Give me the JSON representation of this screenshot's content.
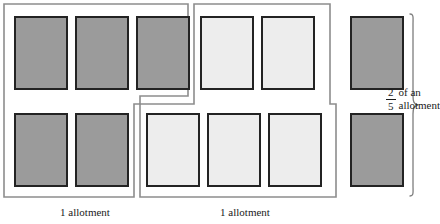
{
  "figure": {
    "colors": {
      "dark_fill": "#9b9b9b",
      "light_fill": "#ededed",
      "cell_border": "#232323",
      "group_outline": "#8d8d8d",
      "text": "#1a1a1a",
      "background": "#ffffff"
    },
    "groups": [
      {
        "name": "allotment-group-left",
        "caption": "1 allotment",
        "fill": "dark",
        "cell_count": 5
      },
      {
        "name": "allotment-group-right",
        "caption": "1 allotment",
        "fill": "light",
        "cell_count": 5
      },
      {
        "name": "partial-allotment-group",
        "fill": "dark",
        "cell_count": 2
      }
    ],
    "cells": [
      {
        "id": "left-top-1",
        "fill": "dark",
        "x": 14,
        "y": 16,
        "w": 54,
        "h": 74
      },
      {
        "id": "left-top-2",
        "fill": "dark",
        "x": 75,
        "y": 16,
        "w": 54,
        "h": 74
      },
      {
        "id": "left-top-3",
        "fill": "dark",
        "x": 136,
        "y": 16,
        "w": 54,
        "h": 74
      },
      {
        "id": "left-bot-1",
        "fill": "dark",
        "x": 14,
        "y": 113,
        "w": 54,
        "h": 74
      },
      {
        "id": "left-bot-2",
        "fill": "dark",
        "x": 75,
        "y": 113,
        "w": 54,
        "h": 74
      },
      {
        "id": "right-top-1",
        "fill": "light",
        "x": 200,
        "y": 16,
        "w": 54,
        "h": 74
      },
      {
        "id": "right-top-2",
        "fill": "light",
        "x": 261,
        "y": 16,
        "w": 54,
        "h": 74
      },
      {
        "id": "right-bot-1",
        "fill": "light",
        "x": 146,
        "y": 113,
        "w": 54,
        "h": 74
      },
      {
        "id": "right-bot-2",
        "fill": "light",
        "x": 207,
        "y": 113,
        "w": 54,
        "h": 74
      },
      {
        "id": "right-bot-3",
        "fill": "light",
        "x": 268,
        "y": 113,
        "w": 54,
        "h": 74
      },
      {
        "id": "partial-top-1",
        "fill": "dark",
        "x": 350,
        "y": 16,
        "w": 54,
        "h": 74
      },
      {
        "id": "partial-bot-1",
        "fill": "dark",
        "x": 350,
        "y": 113,
        "w": 54,
        "h": 74
      }
    ],
    "captions": [
      {
        "id": "caption-left",
        "text": "1 allotment",
        "x": 30,
        "y": 206,
        "w": 110
      },
      {
        "id": "caption-right",
        "text": "1 allotment",
        "x": 160,
        "y": 206,
        "w": 170
      }
    ],
    "fraction_label": {
      "numerator": "2",
      "denominator": "5",
      "text": "of an allotment",
      "x": 386,
      "y": 86
    }
  }
}
